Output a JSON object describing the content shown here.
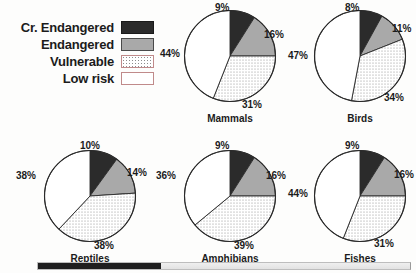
{
  "figure": {
    "title": "",
    "legend": {
      "name": "threat-category-legend",
      "items": [
        {
          "label": "Cr. Endangered",
          "swatch": "black-fill-swatch",
          "color": "#2b2b2b"
        },
        {
          "label": "Endangered",
          "swatch": "gray-fill-swatch",
          "color": "#a9a9a9"
        },
        {
          "label": "Vulnerable",
          "swatch": "stippled-fill-swatch",
          "color": "#ffffff"
        },
        {
          "label": "Low risk",
          "swatch": "white-fill-swatch",
          "color": "#ffffff"
        }
      ]
    }
  },
  "chart_data": [
    {
      "type": "pie",
      "title": "Mammals",
      "categories": [
        "Cr. Endangered",
        "Endangered",
        "Vulnerable",
        "Low risk"
      ],
      "values": [
        9,
        16,
        31,
        44
      ],
      "labels": [
        "9%",
        "16%",
        "31%",
        "44%"
      ],
      "xlabel": "",
      "ylabel": "",
      "legend_position": "top-left",
      "grid": false
    },
    {
      "type": "pie",
      "title": "Birds",
      "categories": [
        "Cr. Endangered",
        "Endangered",
        "Vulnerable",
        "Low risk"
      ],
      "values": [
        8,
        11,
        34,
        47
      ],
      "labels": [
        "8%",
        "11%",
        "34%",
        "47%"
      ],
      "xlabel": "",
      "ylabel": "",
      "legend_position": "top-left",
      "grid": false
    },
    {
      "type": "pie",
      "title": "Reptiles",
      "categories": [
        "Cr. Endangered",
        "Endangered",
        "Vulnerable",
        "Low risk"
      ],
      "values": [
        10,
        14,
        38,
        38
      ],
      "labels": [
        "10%",
        "14%",
        "38%",
        "38%"
      ],
      "xlabel": "",
      "ylabel": "",
      "legend_position": "top-left",
      "grid": false
    },
    {
      "type": "pie",
      "title": "Amphibians",
      "categories": [
        "Cr. Endangered",
        "Endangered",
        "Vulnerable",
        "Low risk"
      ],
      "values": [
        9,
        16,
        39,
        36
      ],
      "labels": [
        "9%",
        "16%",
        "39%",
        "36%"
      ],
      "xlabel": "",
      "ylabel": "",
      "legend_position": "top-left",
      "grid": false
    },
    {
      "type": "pie",
      "title": "Fishes",
      "categories": [
        "Cr. Endangered",
        "Endangered",
        "Vulnerable",
        "Low risk"
      ],
      "values": [
        9,
        16,
        31,
        44
      ],
      "labels": [
        "9%",
        "16%",
        "31%",
        "44%"
      ],
      "xlabel": "",
      "ylabel": "",
      "legend_position": "top-left",
      "grid": false
    }
  ],
  "scrollbar": {
    "orientation": "horizontal",
    "thumb_position_percent": 0
  }
}
